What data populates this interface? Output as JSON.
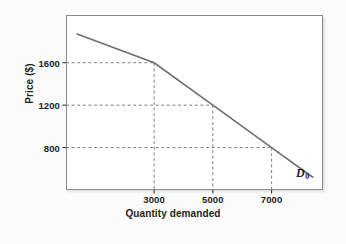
{
  "chart_data": {
    "type": "line",
    "title": "",
    "xlabel": "Quantity demanded",
    "ylabel": "Price ($)",
    "xlim": [
      0,
      8750
    ],
    "ylim": [
      400,
      2050
    ],
    "grid": true,
    "legend_position": "inline-right",
    "xticks": [
      {
        "value": 3000,
        "label": "3000"
      },
      {
        "value": 5000,
        "label": "5000"
      },
      {
        "value": 7000,
        "label": "7000"
      }
    ],
    "yticks": [
      {
        "value": 800,
        "label": "800"
      },
      {
        "value": 1200,
        "label": "1200"
      },
      {
        "value": 1600,
        "label": "1600"
      }
    ],
    "series": [
      {
        "name": "D0",
        "label": "D",
        "label_subscript": "0",
        "color": "#6e6e6e",
        "points": [
          {
            "x": 380,
            "y": 1870
          },
          {
            "x": 3000,
            "y": 1600
          },
          {
            "x": 5000,
            "y": 1200
          },
          {
            "x": 7000,
            "y": 800
          },
          {
            "x": 8400,
            "y": 520
          }
        ]
      }
    ],
    "annotations": [
      {
        "kind": "guide",
        "price": 1600,
        "quantity": 3000
      },
      {
        "kind": "guide",
        "price": 1200,
        "quantity": 5000
      },
      {
        "kind": "guide",
        "price": 800,
        "quantity": 7000
      }
    ],
    "colors": {
      "curve": "#6e6e6e",
      "gridline": "#808080",
      "frame": "#8c8c8c",
      "text": "#231f20",
      "plot_background": "#ffffff",
      "figure_background": "#fbfbfb"
    }
  }
}
